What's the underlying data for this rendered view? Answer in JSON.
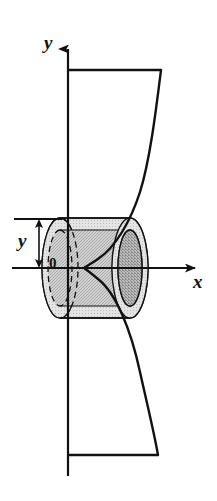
{
  "figure": {
    "type": "math-diagram",
    "width": 217,
    "height": 501,
    "background_color": "#ffffff",
    "stroke_color": "#111111"
  },
  "labels": {
    "y_axis": "y",
    "x_axis": "x",
    "y_measure": "y",
    "origin": "0"
  },
  "axes": {
    "y_axis": {
      "name": "y-axis",
      "x": 68,
      "top": 45,
      "bottom": 476,
      "arrow_at": "top"
    },
    "x_axis": {
      "name": "x-axis",
      "y": 268,
      "left": 12,
      "right": 200,
      "arrow_at": "right"
    }
  },
  "curve": {
    "name": "bounding-curve",
    "description": "Curve sweeping from upper right inward to a waist near the x-axis then outward to lower right",
    "points": [
      [
        161,
        70
      ],
      [
        151,
        135
      ],
      [
        140,
        190
      ],
      [
        127,
        222
      ],
      [
        112,
        244
      ],
      [
        97,
        258
      ],
      [
        88,
        264
      ],
      [
        84,
        267
      ],
      [
        88,
        272
      ],
      [
        97,
        280
      ],
      [
        110,
        294
      ],
      [
        124,
        318
      ],
      [
        138,
        362
      ],
      [
        150,
        412
      ],
      [
        158,
        455
      ]
    ]
  },
  "region": {
    "name": "region-boundaries",
    "top_line": {
      "x1": 68,
      "y1": 70,
      "x2": 161,
      "y2": 70
    },
    "bottom_line": {
      "x1": 68,
      "y1": 455,
      "x2": 158,
      "y2": 455
    }
  },
  "shell": {
    "name": "cylindrical-shell",
    "center_y": 268,
    "top_y": 220,
    "bottom_y": 308,
    "left_cap_cx": 60,
    "right_cap_cx": 130,
    "outer_rx": 18,
    "outer_ry": 50,
    "inner_rx": 12,
    "inner_ry": 38,
    "outer_fill": "#b9b9b9",
    "body_fill": "#c6c6c6",
    "inner_fill": "#9e9e9e",
    "highlight_fill": "#dadada"
  },
  "measure": {
    "name": "y-height-bracket",
    "x": 39,
    "top_y": 219,
    "bottom_y": 268,
    "tick_left": 14,
    "tick_right": 62
  },
  "colors": {
    "stroke": "#111111",
    "shade_light": "#dadada",
    "shade_mid": "#c6c6c6",
    "shade_dark": "#9e9e9e"
  }
}
